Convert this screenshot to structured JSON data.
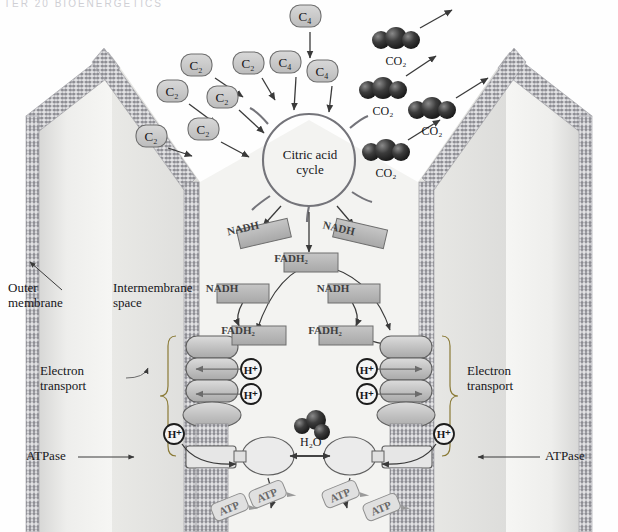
{
  "figure": {
    "header_strip": "TER 20  BIOENERGETICS",
    "background": "#fefefe"
  },
  "colors": {
    "membrane_head": "#8d8d93",
    "membrane_tail": "#d9d9dd",
    "matrix_light": "#f2f2f0",
    "matrix_shade": "#d3d3d2",
    "pill_fill": "#c9c9c9",
    "pill_stroke": "#6e6e6e",
    "box_fill": "#b9b9b9",
    "box_stroke": "#6e6e6e",
    "complex_fill": "#c4c4c4",
    "complex_stroke": "#5f5f5f",
    "co2_sphere": "#2b2b2b",
    "arrow": "#3a3a3a",
    "text": "#16161a"
  },
  "labels": {
    "outer_membrane": "Outer\nmembrane",
    "intermembrane_space": "Intermembrane\nspace",
    "electron_transport_left": "Electron\ntransport",
    "electron_transport_right": "Electron\ntransport",
    "atpase_left": "ATPase",
    "atpase_right": "ATPase",
    "citric_acid_cycle": "Citric acid\ncycle",
    "water": "H₂O"
  },
  "substrates": {
    "c2": [
      {
        "id": "c2-1",
        "label": "C₂",
        "x": 196,
        "y": 66
      },
      {
        "id": "c2-2",
        "label": "C₂",
        "x": 248,
        "y": 64
      },
      {
        "id": "c2-3",
        "label": "C₂",
        "x": 172,
        "y": 92
      },
      {
        "id": "c2-4",
        "label": "C₂",
        "x": 222,
        "y": 98
      },
      {
        "id": "c2-5",
        "label": "C₂",
        "x": 151,
        "y": 137
      },
      {
        "id": "c2-6",
        "label": "C₂",
        "x": 203,
        "y": 130
      }
    ],
    "c4": [
      {
        "id": "c4-1",
        "label": "C₄",
        "x": 305,
        "y": 17
      },
      {
        "id": "c4-2",
        "label": "C₄",
        "x": 285,
        "y": 63
      },
      {
        "id": "c4-3",
        "label": "C₄",
        "x": 322,
        "y": 72
      }
    ]
  },
  "carriers": {
    "nadh_upper": [
      {
        "id": "nadh-u-left",
        "label": "NADH",
        "x": 243,
        "y": 228,
        "rot": -13
      },
      {
        "id": "nadh-u-right",
        "label": "NADH",
        "x": 339,
        "y": 228,
        "rot": 13
      }
    ],
    "fadh2_center": {
      "id": "fadh2-center",
      "label": "FADH₂",
      "x": 291,
      "y": 258
    },
    "nadh_lower": [
      {
        "id": "nadh-l-left",
        "label": "NADH",
        "x": 222,
        "y": 288
      },
      {
        "id": "nadh-l-right",
        "label": "NADH",
        "x": 333,
        "y": 288
      }
    ],
    "fadh2_lower": [
      {
        "id": "fadh2-left",
        "label": "FADH₂",
        "x": 238,
        "y": 330
      },
      {
        "id": "fadh2-right",
        "label": "FADH₂",
        "x": 325,
        "y": 330
      }
    ]
  },
  "protons": [
    {
      "id": "h-left-1",
      "label": "H⁺",
      "x": 251,
      "y": 370
    },
    {
      "id": "h-left-2",
      "label": "H⁺",
      "x": 251,
      "y": 395
    },
    {
      "id": "h-left-3",
      "label": "H⁺",
      "x": 175,
      "y": 434
    },
    {
      "id": "h-right-1",
      "label": "H⁺",
      "x": 367,
      "y": 370
    },
    {
      "id": "h-right-2",
      "label": "H⁺",
      "x": 367,
      "y": 395
    },
    {
      "id": "h-right-3",
      "label": "H⁺",
      "x": 444,
      "y": 434
    }
  ],
  "co2": [
    {
      "id": "co2-1",
      "label": "CO₂",
      "x": 396,
      "y": 40
    },
    {
      "id": "co2-2",
      "label": "CO₂",
      "x": 383,
      "y": 90
    },
    {
      "id": "co2-3",
      "label": "CO₂",
      "x": 432,
      "y": 110
    },
    {
      "id": "co2-4",
      "label": "CO₂",
      "x": 386,
      "y": 152
    }
  ],
  "atp": [
    {
      "id": "atp-1",
      "label": "ATP",
      "x": 229,
      "y": 508,
      "rot": -22
    },
    {
      "id": "atp-2",
      "label": "ATP",
      "x": 267,
      "y": 495,
      "rot": -22
    },
    {
      "id": "atp-3",
      "label": "ATP",
      "x": 340,
      "y": 495,
      "rot": -22
    },
    {
      "id": "atp-4",
      "label": "ATP",
      "x": 381,
      "y": 508,
      "rot": -22
    }
  ]
}
